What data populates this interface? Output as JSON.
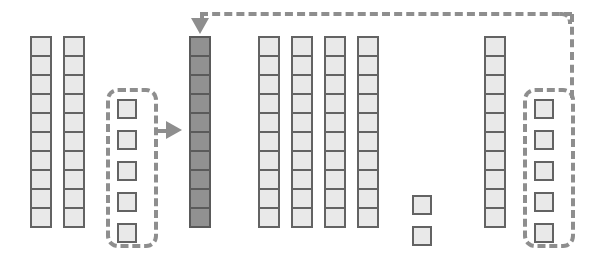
{
  "diagram": {
    "canvas": {
      "width": 595,
      "height": 271,
      "background": "#ffffff"
    },
    "colors": {
      "cell_light_fill": "#e9e9e9",
      "cell_light_border": "#636363",
      "cell_dark_fill": "#919191",
      "cell_dark_border": "#5a5a5a",
      "dashed_stroke": "#8e8e8e",
      "arrow_fill": "#8e8e8e"
    },
    "cell_size": {
      "width": 22,
      "height": 21
    },
    "groups": [
      {
        "id": "column-1",
        "kind": "stack",
        "style": "light",
        "count": 10,
        "x": 30,
        "y": 36,
        "dashed": false,
        "label": ""
      },
      {
        "id": "column-2",
        "kind": "stack",
        "style": "light",
        "count": 10,
        "x": 63,
        "y": 36,
        "dashed": false,
        "label": ""
      },
      {
        "id": "group-left-selected",
        "kind": "spaced",
        "style": "light",
        "count": 5,
        "x": 116,
        "y": 98,
        "dashed": true,
        "label": ""
      },
      {
        "id": "column-highlighted",
        "kind": "stack",
        "style": "dark",
        "count": 10,
        "x": 189,
        "y": 36,
        "dashed": false,
        "label": ""
      },
      {
        "id": "column-4",
        "kind": "stack",
        "style": "light",
        "count": 10,
        "x": 258,
        "y": 36,
        "dashed": false,
        "label": ""
      },
      {
        "id": "column-5",
        "kind": "stack",
        "style": "light",
        "count": 10,
        "x": 291,
        "y": 36,
        "dashed": false,
        "label": ""
      },
      {
        "id": "column-6",
        "kind": "stack",
        "style": "light",
        "count": 10,
        "x": 324,
        "y": 36,
        "dashed": false,
        "label": ""
      },
      {
        "id": "column-7",
        "kind": "stack",
        "style": "light",
        "count": 10,
        "x": 357,
        "y": 36,
        "dashed": false,
        "label": ""
      },
      {
        "id": "column-short",
        "kind": "spaced-short",
        "style": "light",
        "count": 2,
        "x": 411,
        "y": 194,
        "dashed": false,
        "label": ""
      },
      {
        "id": "column-8",
        "kind": "stack",
        "style": "light",
        "count": 10,
        "x": 484,
        "y": 36,
        "dashed": false,
        "label": ""
      },
      {
        "id": "group-right-selected",
        "kind": "spaced",
        "style": "light",
        "count": 5,
        "x": 533,
        "y": 98,
        "dashed": true,
        "label": ""
      }
    ],
    "connectors": [
      {
        "id": "connector-left-to-highlighted",
        "from": "group-left-selected",
        "to": "column-highlighted",
        "style": "dashed",
        "arrow": "right",
        "description": "Dashed path from left selected group pointing right into highlighted column"
      },
      {
        "id": "connector-right-to-highlighted",
        "from": "group-right-selected",
        "to": "column-highlighted",
        "style": "dashed",
        "arrow": "down",
        "description": "Dashed path rising from right selected group, running left across the top, then down into the top of the highlighted column"
      }
    ]
  }
}
